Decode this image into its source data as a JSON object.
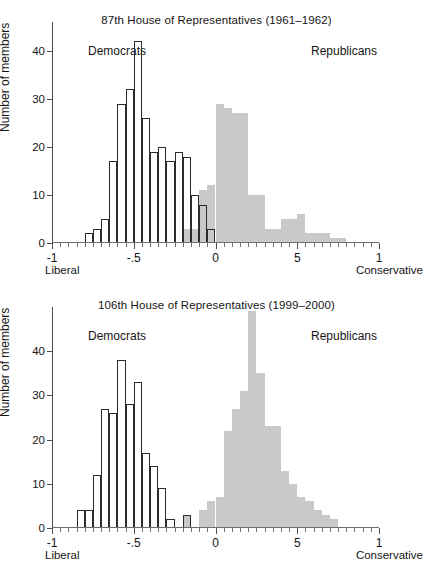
{
  "figure": {
    "ylabel": "Number of members",
    "liberal_label": "Liberal",
    "conservative_label": "Conservative",
    "democrats_label": "Democrats",
    "republicans_label": "Republicans",
    "colors": {
      "republican_fill": "#c9c9c9",
      "democrat_stroke": "#2b2b2b",
      "axis": "#4d4d4d",
      "text": "#151515"
    },
    "y_ticks": [
      0,
      10,
      20,
      30,
      40
    ],
    "y_tick_labels": [
      "0",
      "10",
      "20",
      "30",
      "40"
    ],
    "x_ticks": [
      -1,
      -0.5,
      0,
      0.5,
      1
    ],
    "x_tick_labels": [
      "-1",
      "-.5",
      "0",
      "5",
      "1"
    ]
  },
  "chart_data": [
    {
      "type": "bar",
      "panel_id": "panel-1",
      "title": "87th House of Representatives (1961–1962)",
      "xlabel": "",
      "ylabel": "Number of members",
      "xlim": [
        -1.0,
        1.0
      ],
      "ylim": [
        0,
        46
      ],
      "grid": false,
      "legend": "inline-annotations",
      "bin_width": 0.05,
      "bin_left_edges": [
        -1.0,
        -0.95,
        -0.9,
        -0.85,
        -0.8,
        -0.75,
        -0.7,
        -0.65,
        -0.6,
        -0.55,
        -0.5,
        -0.45,
        -0.4,
        -0.35,
        -0.3,
        -0.25,
        -0.2,
        -0.15,
        -0.1,
        -0.05,
        0.0,
        0.05,
        0.1,
        0.15,
        0.2,
        0.25,
        0.3,
        0.35,
        0.4,
        0.45,
        0.5,
        0.55,
        0.6,
        0.65,
        0.7,
        0.75,
        0.8,
        0.85,
        0.9,
        0.95
      ],
      "series": [
        {
          "name": "Democrats",
          "style": "outline",
          "values": [
            0,
            0,
            0,
            0,
            2,
            3,
            5,
            17,
            29,
            32,
            42,
            26,
            19,
            20,
            17,
            19,
            18,
            10,
            8,
            3,
            0,
            0,
            0,
            0,
            0,
            0,
            0,
            0,
            0,
            0,
            0,
            0,
            0,
            0,
            0,
            0,
            0,
            0,
            0,
            0
          ]
        },
        {
          "name": "Republicans",
          "style": "filled",
          "values": [
            0,
            0,
            0,
            0,
            0,
            0,
            0,
            0,
            0,
            0,
            0,
            0,
            0,
            0,
            0,
            0,
            3,
            3,
            11,
            12,
            29,
            28,
            27,
            27,
            10,
            10,
            3,
            3,
            5,
            5,
            6,
            2,
            2,
            2,
            1,
            1,
            0,
            0,
            0,
            0
          ]
        }
      ]
    },
    {
      "type": "bar",
      "panel_id": "panel-2",
      "title": "106th House of Representatives (1999–2000)",
      "xlabel": "",
      "ylabel": "Number of members",
      "xlim": [
        -1.0,
        1.0
      ],
      "ylim": [
        0,
        50
      ],
      "grid": false,
      "legend": "inline-annotations",
      "bin_width": 0.05,
      "bin_left_edges": [
        -1.0,
        -0.95,
        -0.9,
        -0.85,
        -0.8,
        -0.75,
        -0.7,
        -0.65,
        -0.6,
        -0.55,
        -0.5,
        -0.45,
        -0.4,
        -0.35,
        -0.3,
        -0.25,
        -0.2,
        -0.15,
        -0.1,
        -0.05,
        0.0,
        0.05,
        0.1,
        0.15,
        0.2,
        0.25,
        0.3,
        0.35,
        0.4,
        0.45,
        0.5,
        0.55,
        0.6,
        0.65,
        0.7,
        0.75,
        0.8,
        0.85,
        0.9,
        0.95
      ],
      "series": [
        {
          "name": "Democrats",
          "style": "outline",
          "values": [
            0,
            0,
            0,
            4,
            4,
            12,
            27,
            26,
            38,
            28,
            33,
            17,
            14,
            9,
            2,
            0,
            3,
            0,
            0,
            0,
            0,
            0,
            0,
            0,
            0,
            0,
            0,
            0,
            0,
            0,
            0,
            0,
            0,
            0,
            0,
            0,
            0,
            0,
            0,
            0
          ]
        },
        {
          "name": "Republicans",
          "style": "filled",
          "values": [
            0,
            0,
            0,
            0,
            0,
            0,
            0,
            0,
            0,
            0,
            0,
            0,
            0,
            0,
            0,
            0,
            3,
            0,
            4,
            6,
            7,
            22,
            27,
            31,
            49,
            35,
            23,
            23,
            13,
            10,
            7,
            6,
            4,
            3,
            2,
            0,
            0,
            0,
            0,
            0
          ]
        }
      ]
    }
  ]
}
